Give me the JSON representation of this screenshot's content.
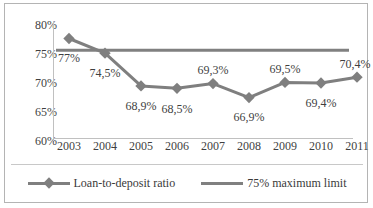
{
  "chart_data": {
    "type": "line",
    "title": "",
    "subtitle": "",
    "xlabel": "",
    "ylabel": "",
    "ylim": [
      60,
      80
    ],
    "ytick_step": 5,
    "grid": false,
    "legend_position": "bottom",
    "decimal_separator": ",",
    "categories": [
      "2003",
      "2004",
      "2005",
      "2006",
      "2007",
      "2008",
      "2009",
      "2010",
      "2011"
    ],
    "series": [
      {
        "name": "Loan-to-deposit ratio",
        "marker": "diamond",
        "color": "#7f7f7f",
        "values": [
          77.0,
          74.5,
          68.9,
          68.5,
          69.3,
          66.9,
          69.5,
          69.4,
          70.4
        ],
        "data_labels": [
          "77%",
          "74,5%",
          "68,9%",
          "68,5%",
          "69,3%",
          "66,9%",
          "69,5%",
          "69,4%",
          "70,4%"
        ]
      },
      {
        "name": "75% maximum limit",
        "marker": "none",
        "color": "#808080",
        "constant_value": 75.0,
        "values": [
          75.0,
          75.0,
          75.0,
          75.0,
          75.0,
          75.0,
          75.0,
          75.0,
          75.0
        ]
      }
    ],
    "y_tick_labels": [
      "80%",
      "75%",
      "70%",
      "65%",
      "60%"
    ],
    "y_tick_values": [
      80,
      75,
      70,
      65,
      60
    ]
  },
  "axes": {
    "y_ticks": [
      {
        "label": "80%",
        "value": 80
      },
      {
        "label": "75%",
        "value": 75
      },
      {
        "label": "70%",
        "value": 70
      },
      {
        "label": "65%",
        "value": 65
      },
      {
        "label": "60%",
        "value": 60
      }
    ],
    "x_ticks": [
      {
        "label": "2003"
      },
      {
        "label": "2004"
      },
      {
        "label": "2005"
      },
      {
        "label": "2006"
      },
      {
        "label": "2007"
      },
      {
        "label": "2008"
      },
      {
        "label": "2009"
      },
      {
        "label": "2010"
      },
      {
        "label": "2011"
      }
    ]
  },
  "labels": {
    "points": [
      {
        "text": "77%"
      },
      {
        "text": "74,5%"
      },
      {
        "text": "68,9%"
      },
      {
        "text": "68,5%"
      },
      {
        "text": "69,3%"
      },
      {
        "text": "66,9%"
      },
      {
        "text": "69,5%"
      },
      {
        "text": "69,4%"
      },
      {
        "text": "70,4%"
      }
    ]
  },
  "legend": {
    "items": [
      {
        "label": "Loan-to-deposit ratio",
        "color": "#7f7f7f",
        "marker": "diamond"
      },
      {
        "label": "75% maximum limit",
        "color": "#808080",
        "marker": "none"
      }
    ]
  },
  "colors": {
    "series_line": "#7f7f7f",
    "limit_line": "#808080",
    "axis": "#c0c0c0",
    "text": "#3f3f3f",
    "frame": "#b4b4b4",
    "background": "#ffffff"
  }
}
